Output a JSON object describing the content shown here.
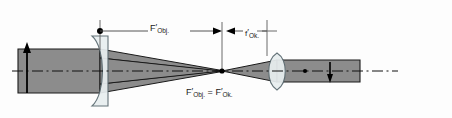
{
  "figure": {
    "title_visible": false,
    "type": "optical-ray-diagram"
  },
  "colors": {
    "background": "#fdfdfd",
    "beam_fill": "#8c8c8c",
    "beam_outline": "#1a1a1a",
    "lens_fill": "#e8eef0",
    "lens_outline": "#5a6a70",
    "axis": "#111111",
    "dimension_line": "#555555",
    "label_text": "#1a1a1a",
    "arrow": "#000000"
  },
  "labels": {
    "focal_objective": {
      "base": "F",
      "prime": "′",
      "sub": "Obj."
    },
    "focal_eyepiece": {
      "base": "f",
      "prime": "′",
      "sub": "Ok."
    },
    "common_focus": {
      "text": "F′Obj. = F′Ok.",
      "left_base": "F",
      "left_prime": "′",
      "left_sub": "Obj.",
      "equals": " = ",
      "right_base": "F",
      "right_prime": "′",
      "right_sub": "Ok."
    }
  },
  "elements": {
    "objective_lens": {
      "name": "Objektiv",
      "shape": "plano-convex",
      "x": 100
    },
    "eyepiece_lens": {
      "name": "Okular",
      "shape": "biconvex",
      "x": 277
    },
    "focal_plane": {
      "x": 222,
      "description": "common focal plane"
    },
    "eyepiece_focal_marker": {
      "x": 267
    },
    "object_arrow": {
      "x": 27,
      "direction": "up"
    },
    "image_arrow": {
      "x": 330,
      "direction": "down"
    },
    "optical_axis": {
      "y": 71,
      "style": "dash-dot"
    }
  },
  "dimensions": {
    "f_objective": {
      "from_x": 100,
      "to_x": 222,
      "label_key": "focal_objective"
    },
    "f_eyepiece": {
      "from_x": 222,
      "to_x": 267,
      "label_key": "focal_eyepiece"
    }
  }
}
